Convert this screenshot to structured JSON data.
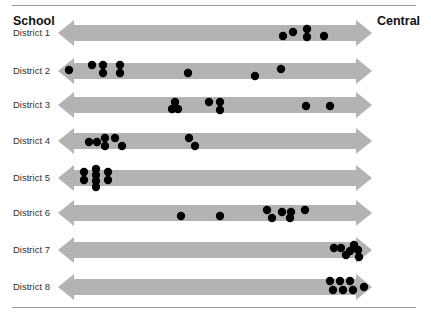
{
  "chart_data": {
    "type": "scatter",
    "title": "",
    "left_label": "School",
    "right_label": "Central",
    "xlabel": "",
    "ylabel": "",
    "grid": false,
    "legend": null,
    "x_axis": {
      "from": 58,
      "to": 372,
      "direction": "School ← → Central"
    },
    "rows": [
      {
        "label": "District 1",
        "y": 33,
        "points": [
          [
            283,
            36
          ],
          [
            293,
            32
          ],
          [
            307,
            29
          ],
          [
            307,
            37
          ],
          [
            324,
            36
          ]
        ]
      },
      {
        "label": "District 2",
        "y": 71,
        "points": [
          [
            69,
            70
          ],
          [
            92,
            65
          ],
          [
            103,
            65
          ],
          [
            103,
            73
          ],
          [
            120,
            65
          ],
          [
            120,
            73
          ],
          [
            188,
            73
          ],
          [
            255,
            76
          ],
          [
            281,
            69
          ]
        ]
      },
      {
        "label": "District 3",
        "y": 105,
        "points": [
          [
            175,
            102
          ],
          [
            172,
            109
          ],
          [
            178,
            109
          ],
          [
            209,
            102
          ],
          [
            220,
            102
          ],
          [
            220,
            110
          ],
          [
            306,
            106
          ],
          [
            330,
            106
          ]
        ]
      },
      {
        "label": "District 4",
        "y": 141,
        "points": [
          [
            89,
            142
          ],
          [
            97,
            142
          ],
          [
            105,
            138
          ],
          [
            105,
            146
          ],
          [
            115,
            138
          ],
          [
            122,
            146
          ],
          [
            189,
            138
          ],
          [
            195,
            146
          ]
        ]
      },
      {
        "label": "District 5",
        "y": 178,
        "points": [
          [
            84,
            172
          ],
          [
            84,
            180
          ],
          [
            96,
            169
          ],
          [
            96,
            175
          ],
          [
            96,
            181
          ],
          [
            96,
            187
          ],
          [
            108,
            172
          ],
          [
            108,
            180
          ]
        ]
      },
      {
        "label": "District 6",
        "y": 213,
        "points": [
          [
            181,
            216
          ],
          [
            220,
            216
          ],
          [
            267,
            210
          ],
          [
            272,
            218
          ],
          [
            282,
            212
          ],
          [
            290,
            218
          ],
          [
            291,
            212
          ],
          [
            305,
            210
          ]
        ]
      },
      {
        "label": "District 7",
        "y": 250,
        "points": [
          [
            334,
            248
          ],
          [
            341,
            248
          ],
          [
            346,
            255
          ],
          [
            350,
            251
          ],
          [
            354,
            245
          ],
          [
            358,
            250
          ],
          [
            359,
            257
          ]
        ]
      },
      {
        "label": "District 8",
        "y": 287,
        "points": [
          [
            330,
            281
          ],
          [
            340,
            281
          ],
          [
            350,
            281
          ],
          [
            333,
            290
          ],
          [
            343,
            290
          ],
          [
            353,
            290
          ],
          [
            364,
            287
          ]
        ]
      }
    ],
    "colors": {
      "arrow": "#b3b3b3",
      "dot": "#000000",
      "rule": "#9a9a9a"
    }
  }
}
